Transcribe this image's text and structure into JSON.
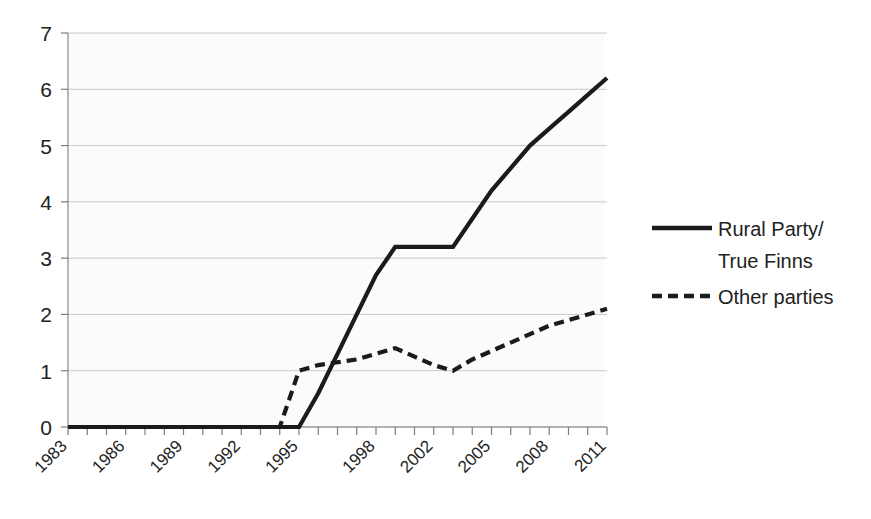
{
  "chart_data": {
    "type": "line",
    "title": "",
    "xlabel": "",
    "ylabel": "",
    "ylim": [
      0,
      7
    ],
    "yticks": [
      "0",
      "1",
      "2",
      "3",
      "4",
      "5",
      "6",
      "7"
    ],
    "grid": true,
    "legend_position": "right",
    "x": [
      1983,
      1984,
      1985,
      1986,
      1987,
      1988,
      1989,
      1990,
      1991,
      1992,
      1993,
      1994,
      1995,
      1996,
      1997,
      1998,
      1999,
      2000,
      2001,
      2002,
      2003,
      2004,
      2005,
      2006,
      2007,
      2008,
      2009,
      2010,
      2011
    ],
    "xtick_labels": [
      "1983",
      "1986",
      "1989",
      "1992",
      "1995",
      "1998",
      "2002",
      "2005",
      "2008",
      "2011"
    ],
    "series": [
      {
        "name": "Rural Party/ True Finns",
        "style": "solid",
        "color": "#1b1b1b",
        "values": [
          0,
          0,
          0,
          0,
          0,
          0,
          0,
          0,
          0,
          0,
          0,
          0,
          0,
          0.6,
          1.3,
          2.0,
          2.7,
          3.2,
          3.2,
          3.2,
          3.2,
          3.7,
          4.2,
          4.6,
          5.0,
          5.3,
          5.6,
          5.9,
          6.2
        ]
      },
      {
        "name": "Other parties",
        "style": "dashed",
        "color": "#1b1b1b",
        "values": [
          0,
          0,
          0,
          0,
          0,
          0,
          0,
          0,
          0,
          0,
          0,
          0,
          1.0,
          1.1,
          1.15,
          1.2,
          1.3,
          1.4,
          1.25,
          1.1,
          1.0,
          1.2,
          1.35,
          1.5,
          1.65,
          1.8,
          1.9,
          2.0,
          2.1
        ]
      }
    ],
    "annotations": []
  },
  "legend": {
    "entries": [
      {
        "label_line1": "Rural Party/",
        "label_line2": "True Finns",
        "marker": "solid-line-icon"
      },
      {
        "label_line1": "Other parties",
        "label_line2": "",
        "marker": "dashed-line-icon"
      }
    ]
  },
  "colors": {
    "series": "#1b1b1b",
    "gridline": "#c9c9c9",
    "axis": "#9a9a9a",
    "plot_background": "#fafafa",
    "page_background": "#ffffff",
    "text": "#222222"
  }
}
